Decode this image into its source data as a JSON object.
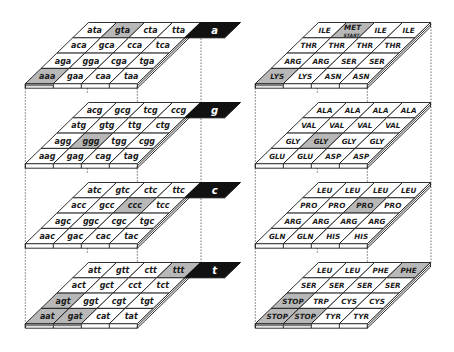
{
  "colors": {
    "highlight": "#b8b8b8",
    "cell": "#ffffff",
    "tab": "#111111",
    "line": "#1a1a1a"
  },
  "left_diagram": {
    "title": "codon-cube",
    "layers": [
      {
        "label": "a",
        "rows": [
          [
            "ata",
            "gta",
            "cta",
            "tta"
          ],
          [
            "aca",
            "gca",
            "cca",
            "tca"
          ],
          [
            "aga",
            "gga",
            "cga",
            "tga"
          ],
          [
            "aaa",
            "gaa",
            "caa",
            "taa"
          ]
        ],
        "highlighted": [
          [
            0,
            1
          ],
          [
            3,
            0
          ]
        ]
      },
      {
        "label": "g",
        "rows": [
          [
            "acg",
            "gcg",
            "tcg",
            "ccg"
          ],
          [
            "atg",
            "gtg",
            "ttg",
            "ctg"
          ],
          [
            "agg",
            "ggg",
            "tgg",
            "cgg"
          ],
          [
            "aag",
            "gag",
            "cag",
            "tag"
          ]
        ],
        "highlighted": [
          [
            2,
            1
          ]
        ]
      },
      {
        "label": "c",
        "rows": [
          [
            "atc",
            "gtc",
            "ctc",
            "ttc"
          ],
          [
            "acc",
            "gcc",
            "ccc",
            "tcc"
          ],
          [
            "agc",
            "ggc",
            "cgc",
            "tgc"
          ],
          [
            "aac",
            "gac",
            "cac",
            "tac"
          ]
        ],
        "highlighted": [
          [
            1,
            2
          ]
        ]
      },
      {
        "label": "t",
        "rows": [
          [
            "att",
            "gtt",
            "ctt",
            "ttt"
          ],
          [
            "act",
            "gct",
            "cct",
            "tct"
          ],
          [
            "agt",
            "ggt",
            "cgt",
            "tgt"
          ],
          [
            "aat",
            "gat",
            "cat",
            "tat"
          ]
        ],
        "highlighted": [
          [
            0,
            3
          ],
          [
            2,
            0
          ],
          [
            3,
            0
          ],
          [
            3,
            1
          ]
        ]
      }
    ]
  },
  "right_diagram": {
    "title": "amino-acid-cube",
    "layers": [
      {
        "rows": [
          [
            "ILE",
            "MET",
            "ILE",
            "ILE"
          ],
          [
            "THR",
            "THR",
            "THR",
            "THR"
          ],
          [
            "ARG",
            "ARG",
            "SER",
            "SER"
          ],
          [
            "LYS",
            "LYS",
            "ASN",
            "ASN"
          ]
        ],
        "sublabels": {
          "0-1": "START"
        },
        "highlighted": [
          [
            0,
            1
          ],
          [
            3,
            0
          ]
        ]
      },
      {
        "rows": [
          [
            "ALA",
            "ALA",
            "ALA",
            "ALA"
          ],
          [
            "VAL",
            "VAL",
            "VAL",
            "VAL"
          ],
          [
            "GLY",
            "GLY",
            "GLY",
            "GLY"
          ],
          [
            "GLU",
            "GLU",
            "ASP",
            "ASP"
          ]
        ],
        "highlighted": [
          [
            2,
            1
          ]
        ]
      },
      {
        "rows": [
          [
            "LEU",
            "LEU",
            "LEU",
            "LEU"
          ],
          [
            "PRO",
            "PRO",
            "PRO",
            "PRO"
          ],
          [
            "ARG",
            "ARG",
            "ARG",
            "ARG"
          ],
          [
            "GLN",
            "GLN",
            "HIS",
            "HIS"
          ]
        ],
        "highlighted": [
          [
            1,
            2
          ]
        ]
      },
      {
        "rows": [
          [
            "LEU",
            "LEU",
            "PHE",
            "PHE"
          ],
          [
            "SER",
            "SER",
            "SER",
            "SER"
          ],
          [
            "STOP",
            "TRP",
            "CYS",
            "CYS"
          ],
          [
            "STOP",
            "STOP",
            "TYR",
            "TYR"
          ]
        ],
        "highlighted": [
          [
            0,
            3
          ],
          [
            2,
            0
          ],
          [
            3,
            0
          ],
          [
            3,
            1
          ]
        ]
      }
    ]
  }
}
